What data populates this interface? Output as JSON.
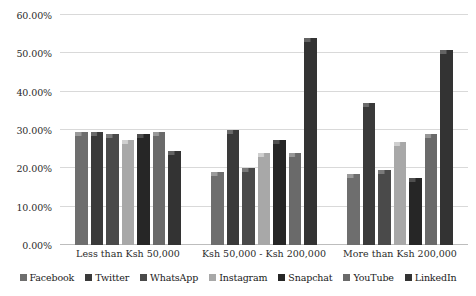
{
  "chart_data": {
    "type": "bar",
    "title": "",
    "subtitle": "",
    "xlabel": "",
    "ylabel": "",
    "ylim": [
      0,
      60
    ],
    "grid": "horizontal",
    "legend_position": "bottom",
    "y_tick_labels": [
      "0.00%",
      "10.00%",
      "20.00%",
      "30.00%",
      "40.00%",
      "50.00%",
      "60.00%"
    ],
    "y_tick_values": [
      0,
      10,
      20,
      30,
      40,
      50,
      60
    ],
    "categories": [
      "Less than Ksh 50,000",
      "Ksh 50,000 - Ksh 200,000",
      "More than Ksh 200,000"
    ],
    "series": [
      {
        "name": "Facebook",
        "color": "#6e6e6e",
        "bevel": "#9a9a9a",
        "values": [
          29.5,
          19.0,
          18.5
        ]
      },
      {
        "name": "Twitter",
        "color": "#3a3a3a",
        "bevel": "#6b6b6b",
        "values": [
          29.5,
          30.0,
          37.0
        ]
      },
      {
        "name": "WhatsApp",
        "color": "#4a4a4a",
        "bevel": "#7a7a7a",
        "values": [
          29.0,
          20.0,
          19.5
        ]
      },
      {
        "name": "Instagram",
        "color": "#a8a8a8",
        "bevel": "#cfcfcf",
        "values": [
          27.5,
          24.0,
          27.0
        ]
      },
      {
        "name": "Snapchat",
        "color": "#262626",
        "bevel": "#4f4f4f",
        "values": [
          29.0,
          27.5,
          17.5
        ]
      },
      {
        "name": "YouTube",
        "color": "#6a6a6a",
        "bevel": "#979797",
        "values": [
          29.5,
          24.0,
          29.0
        ]
      },
      {
        "name": "LinkedIn",
        "color": "#333333",
        "bevel": "#636363",
        "values": [
          24.5,
          54.0,
          51.0
        ]
      }
    ]
  },
  "legend": {
    "items": [
      {
        "label": "Facebook"
      },
      {
        "label": "Twitter"
      },
      {
        "label": "WhatsApp"
      },
      {
        "label": "Instagram"
      },
      {
        "label": "Snapchat"
      },
      {
        "label": "YouTube"
      },
      {
        "label": "LinkedIn"
      }
    ]
  }
}
